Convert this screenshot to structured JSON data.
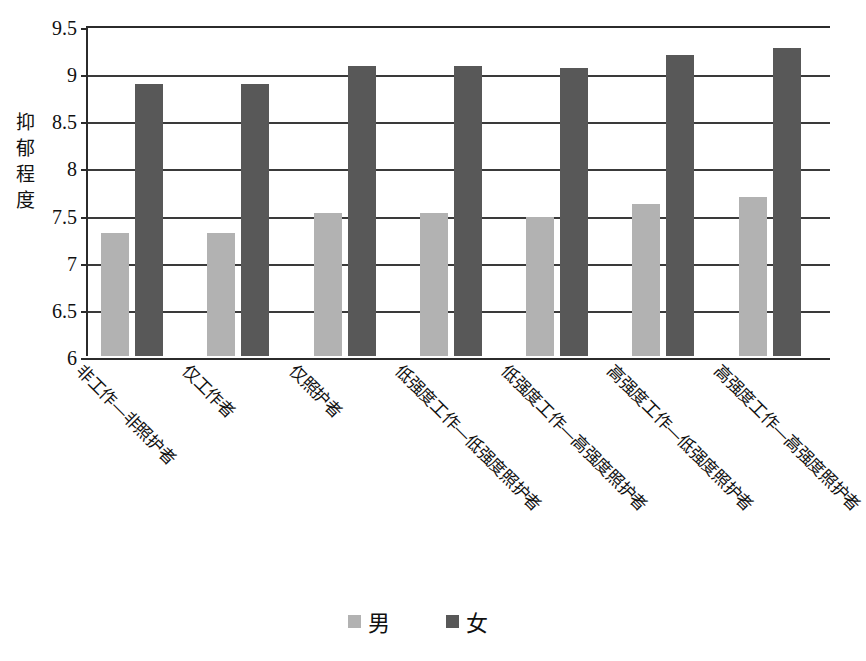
{
  "chart_data": {
    "type": "bar",
    "title": "",
    "xlabel": "",
    "ylabel": "抑郁程度",
    "ylim": [
      6,
      9.5
    ],
    "ytick_step": 0.5,
    "ytick_labels": [
      "9.5",
      "9",
      "8.5",
      "8",
      "7.5",
      "7",
      "6.5",
      "6"
    ],
    "ytick_values": [
      9.5,
      9,
      8.5,
      8,
      7.5,
      7,
      6.5,
      6
    ],
    "grid": true,
    "legend_position": "bottom-center",
    "categories": [
      "非工作—非照护者",
      "仅工作者",
      "仅照护者",
      "低强度工作—低强度照护者",
      "低强度工作—高强度照护者",
      "高强度工作—低强度照护者",
      "高强度工作—高强度照护者"
    ],
    "series": [
      {
        "name": "男",
        "color": "#b2b2b2",
        "values": [
          7.3,
          7.3,
          7.52,
          7.52,
          7.47,
          7.61,
          7.69
        ]
      },
      {
        "name": "女",
        "color": "#585858",
        "values": [
          8.88,
          8.88,
          9.08,
          9.08,
          9.05,
          9.19,
          9.27
        ]
      }
    ]
  },
  "axis": {
    "y_title_chars": [
      "抑",
      "郁",
      "程",
      "度"
    ]
  },
  "legend": {
    "items": [
      {
        "label": "男",
        "color": "#b2b2b2"
      },
      {
        "label": "女",
        "color": "#585858"
      }
    ]
  }
}
